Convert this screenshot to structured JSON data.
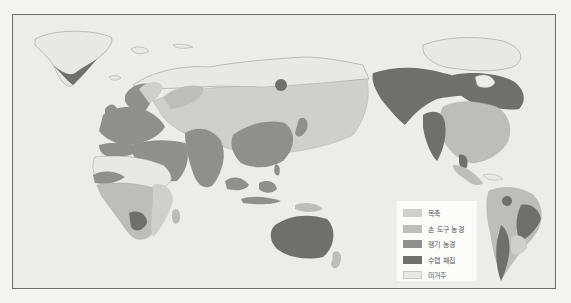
{
  "map": {
    "type": "world-subsistence-map",
    "projection_center": "Pacific (Eurasia/Africa left, Americas right)"
  },
  "legend": {
    "items": [
      {
        "label": "목축",
        "color": "#cfcfcc"
      },
      {
        "label": "손 도구 농경",
        "color": "#bdbdba"
      },
      {
        "label": "쟁기 농경",
        "color": "#8f8f8d"
      },
      {
        "label": "수렵 채집",
        "color": "#6f6f6d"
      },
      {
        "label": "미거주",
        "color": "#e8e8e6"
      }
    ]
  },
  "colors": {
    "ocean": "#ececea",
    "frame_border": "#6e6e6e",
    "pastoral": "#cfcfcc",
    "hand_tool": "#bdbdba",
    "plow": "#8f8f8d",
    "hunting": "#6f6f6d",
    "uninhabited": "#e8e8e6",
    "coast": "#9a9a98"
  }
}
